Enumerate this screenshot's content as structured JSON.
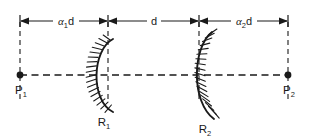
{
  "figure": {
    "type": "optical-resonator-diagram",
    "background_color": "#ffffff",
    "line_color": "#1a1a1a"
  },
  "dimensions": [
    {
      "name": "left-segment",
      "symbol": "α",
      "subscript": "1",
      "suffix": "d",
      "full_label": "α1d",
      "from_x": 20,
      "to_x": 108
    },
    {
      "name": "middle-segment",
      "symbol": "d",
      "subscript": "",
      "suffix": "",
      "full_label": "d",
      "from_x": 108,
      "to_x": 199
    },
    {
      "name": "right-segment",
      "symbol": "α",
      "subscript": "2",
      "suffix": "d",
      "full_label": "α2d",
      "from_x": 199,
      "to_x": 288
    }
  ],
  "points": [
    {
      "name": "left-point",
      "label_base": "P",
      "label_sub": "1",
      "full_label": "P1",
      "x": 20,
      "y": 75
    },
    {
      "name": "right-point",
      "label_base": "P",
      "label_sub": "2",
      "full_label": "P2",
      "x": 288,
      "y": 75
    }
  ],
  "mirrors": [
    {
      "name": "mirror-one",
      "label_base": "R",
      "label_sub": "1",
      "full_label": "R1",
      "vertex_x": 108,
      "curve_direction": "opens-right",
      "hatch_side": "left"
    },
    {
      "name": "mirror-two",
      "label_base": "R",
      "label_sub": "2",
      "full_label": "R2",
      "vertex_x": 199,
      "curve_direction": "opens-left",
      "hatch_side": "right"
    }
  ],
  "axis": {
    "name": "optical-axis",
    "style": "dashed",
    "y": 75
  }
}
